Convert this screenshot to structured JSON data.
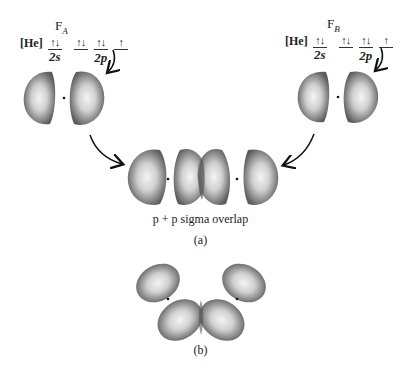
{
  "atoms": [
    {
      "name": "F",
      "subscript": "A",
      "core": "[He]",
      "orbitals_2s": [
        {
          "electrons": "↑↓"
        }
      ],
      "orbitals_2p": [
        {
          "electrons": "↑↓"
        },
        {
          "electrons": "↑↓"
        },
        {
          "electrons": "↑"
        }
      ],
      "label_2s": "2s",
      "label_2p": "2p"
    },
    {
      "name": "F",
      "subscript": "B",
      "core": "[He]",
      "orbitals_2s": [
        {
          "electrons": "↑↓"
        }
      ],
      "orbitals_2p": [
        {
          "electrons": "↑↓"
        },
        {
          "electrons": "↑↓"
        },
        {
          "electrons": "↑"
        }
      ],
      "label_2s": "2s",
      "label_2p": "2p"
    }
  ],
  "panel_a": {
    "caption": "p + p sigma overlap",
    "label": "(a)"
  },
  "panel_b": {
    "label": "(b)"
  },
  "colors": {
    "lobe_dark": "#5a5a5a",
    "lobe_light": "#f2f2f2",
    "arrow": "#111111"
  }
}
